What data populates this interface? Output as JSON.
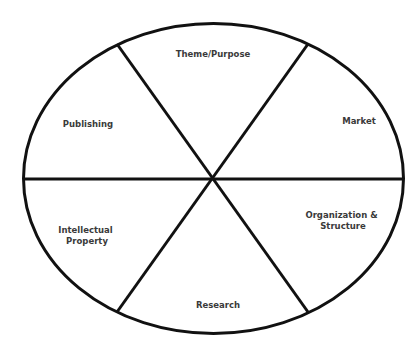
{
  "diagram": {
    "type": "segmented-ellipse",
    "segment_count": 6,
    "colors": {
      "line": "#111111",
      "text": "#3a3a3a",
      "background": "#ffffff"
    },
    "segments": [
      {
        "id": "theme-purpose",
        "lines": [
          "Theme/Purpose"
        ]
      },
      {
        "id": "market",
        "lines": [
          "Market"
        ]
      },
      {
        "id": "organization-structure",
        "lines": [
          "Organization &",
          "Structure"
        ]
      },
      {
        "id": "research",
        "lines": [
          "Research"
        ]
      },
      {
        "id": "intellectual-property",
        "lines": [
          "Intellectual",
          "Property"
        ]
      },
      {
        "id": "publishing",
        "lines": [
          "Publishing"
        ]
      }
    ]
  }
}
